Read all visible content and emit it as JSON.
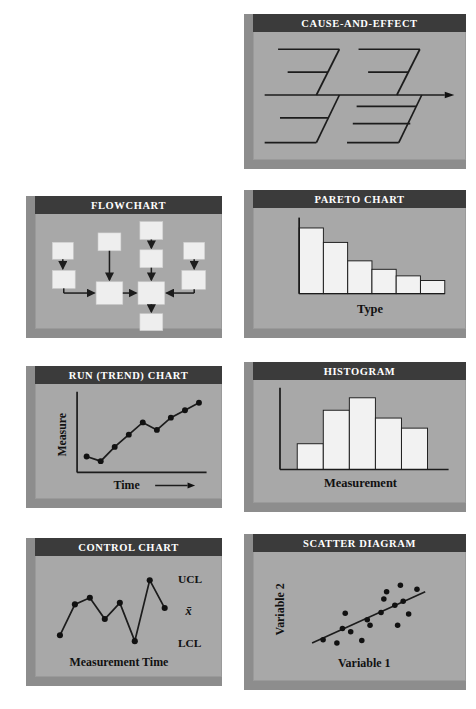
{
  "page": {
    "background": "#ffffff",
    "card_face_color": "#a8a8a8",
    "card_header_color": "#3b3b3b",
    "card_header_text_color": "#ffffff",
    "bevel_color": "#8d8d8d",
    "ink_color": "#1c1c1c",
    "shape_fill": "#eeeeee"
  },
  "cards": [
    {
      "id": "cause-and-effect",
      "title": "CAUSE-AND-EFFECT",
      "labels": []
    },
    {
      "id": "flowchart",
      "title": "FLOWCHART",
      "labels": []
    },
    {
      "id": "pareto-chart",
      "title": "PARETO CHART",
      "labels": [
        "Type"
      ]
    },
    {
      "id": "run-trend-chart",
      "title": "RUN (TREND) CHART",
      "labels": [
        "Measure",
        "Time"
      ]
    },
    {
      "id": "histogram",
      "title": "HISTOGRAM",
      "labels": [
        "Measurement"
      ]
    },
    {
      "id": "control-chart",
      "title": "CONTROL CHART",
      "labels": [
        "UCL",
        "x̄",
        "LCL",
        "Measurement Time"
      ]
    },
    {
      "id": "scatter-diagram",
      "title": "SCATTER DIAGRAM",
      "labels": [
        "Variable 2",
        "Variable 1"
      ]
    }
  ],
  "cause_effect": {
    "title": "CAUSE-AND-EFFECT",
    "spine_arrow": true,
    "bones_above": 2,
    "bones_below": 2,
    "sub_bones_per_bone": 2
  },
  "flowchart": {
    "title": "FLOWCHART",
    "box_count": 10,
    "arrow_count": 9
  },
  "chart_data": [
    {
      "id": "pareto-chart",
      "type": "bar",
      "title": "PARETO CHART",
      "xlabel": "Type",
      "ylabel": "",
      "categories": [
        "1",
        "2",
        "3",
        "4",
        "5",
        "6"
      ],
      "values": [
        100,
        78,
        50,
        37,
        27,
        20
      ],
      "ylim": [
        0,
        110
      ],
      "grid": false,
      "legend": false
    },
    {
      "id": "run-trend-chart",
      "type": "line",
      "title": "RUN (TREND) CHART",
      "xlabel": "Time",
      "ylabel": "Measure",
      "x": [
        1,
        2,
        3,
        4,
        5,
        6,
        7,
        8,
        9
      ],
      "values": [
        18,
        11,
        32,
        50,
        68,
        57,
        75,
        86,
        97
      ],
      "ylim": [
        0,
        105
      ],
      "markers": true,
      "grid": false,
      "legend": false
    },
    {
      "id": "histogram",
      "type": "bar",
      "title": "HISTOGRAM",
      "xlabel": "Measurement",
      "ylabel": "",
      "categories": [
        "1",
        "2",
        "3",
        "4",
        "5"
      ],
      "values": [
        33,
        76,
        92,
        66,
        53
      ],
      "ylim": [
        0,
        100
      ],
      "grid": false,
      "legend": false
    },
    {
      "id": "control-chart",
      "type": "line",
      "title": "CONTROL CHART",
      "xlabel": "Measurement Time",
      "ylabel": "",
      "x": [
        1,
        2,
        3,
        4,
        5,
        6,
        7,
        8,
        9
      ],
      "values": [
        18,
        60,
        69,
        40,
        62,
        10,
        93,
        55
      ],
      "annotations": [
        "UCL",
        "x̄",
        "LCL"
      ],
      "ylim": [
        0,
        100
      ],
      "markers": true,
      "grid": false,
      "legend": false
    },
    {
      "id": "scatter-diagram",
      "type": "scatter",
      "title": "SCATTER DIAGRAM",
      "xlabel": "Variable 1",
      "ylabel": "Variable 2",
      "points": [
        [
          16,
          12
        ],
        [
          26,
          8
        ],
        [
          30,
          26
        ],
        [
          32,
          45
        ],
        [
          36,
          22
        ],
        [
          44,
          11
        ],
        [
          48,
          37
        ],
        [
          50,
          30
        ],
        [
          58,
          46
        ],
        [
          60,
          63
        ],
        [
          62,
          72
        ],
        [
          68,
          55
        ],
        [
          70,
          30
        ],
        [
          72,
          80
        ],
        [
          74,
          60
        ],
        [
          78,
          44
        ],
        [
          84,
          75
        ]
      ],
      "trendline": true,
      "xlim": [
        0,
        100
      ],
      "ylim": [
        0,
        100
      ],
      "grid": false,
      "legend": false
    }
  ]
}
